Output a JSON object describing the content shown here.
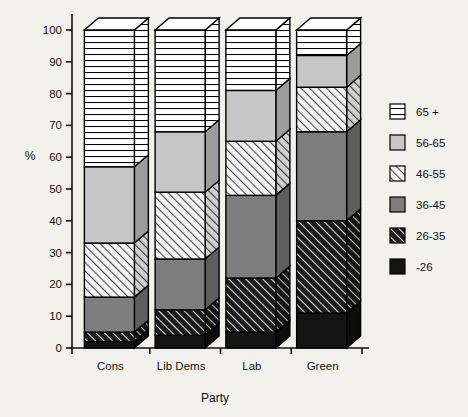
{
  "chart_data": {
    "type": "bar",
    "title": "",
    "xlabel": "Party",
    "ylabel": "%",
    "ylim": [
      0,
      100
    ],
    "yticks": [
      0,
      10,
      20,
      30,
      40,
      50,
      60,
      70,
      80,
      90,
      100
    ],
    "ytick_labels": [
      "0",
      "10",
      "20",
      "30",
      "40",
      "50",
      "60",
      "70",
      "80",
      "90",
      "100"
    ],
    "grid": false,
    "stacked": true,
    "legend_position": "right",
    "categories": [
      "Cons",
      "Lib Dems",
      "Lab",
      "Green"
    ],
    "series": [
      {
        "name": "-26",
        "fill": "solid-black",
        "color": "#1a1a1a",
        "values": [
          2,
          4,
          5,
          11
        ]
      },
      {
        "name": "26-35",
        "fill": "dark-diagonal",
        "color": "#2b2b2b",
        "values": [
          3,
          8,
          17,
          29
        ]
      },
      {
        "name": "36-45",
        "fill": "solid-gray",
        "color": "#7a7a7a",
        "values": [
          11,
          16,
          26,
          28
        ]
      },
      {
        "name": "46-55",
        "fill": "light-diagonal",
        "color": "#e3e3e3",
        "values": [
          17,
          21,
          17,
          14
        ]
      },
      {
        "name": "56-65",
        "fill": "solid-light-gray",
        "color": "#c4c4c4",
        "values": [
          24,
          19,
          16,
          10
        ]
      },
      {
        "name": "65 +",
        "fill": "horizontal-lines",
        "color": "#ffffff",
        "values": [
          43,
          32,
          19,
          8
        ]
      }
    ],
    "cumulative_tops": {
      "Cons": [
        2,
        5,
        16,
        33,
        57,
        100
      ],
      "Lib Dems": [
        4,
        12,
        28,
        49,
        68,
        100
      ],
      "Lab": [
        5,
        22,
        48,
        65,
        81,
        100
      ],
      "Green": [
        11,
        40,
        68,
        82,
        92,
        100
      ]
    }
  },
  "legend": {
    "items": [
      {
        "label": "65 +",
        "fill": "horizontal-lines"
      },
      {
        "label": "56-65",
        "fill": "solid-light-gray"
      },
      {
        "label": "46-55",
        "fill": "light-diagonal"
      },
      {
        "label": "36-45",
        "fill": "solid-gray"
      },
      {
        "label": "26-35",
        "fill": "dark-diagonal"
      },
      {
        "label": "-26",
        "fill": "solid-black"
      }
    ]
  }
}
